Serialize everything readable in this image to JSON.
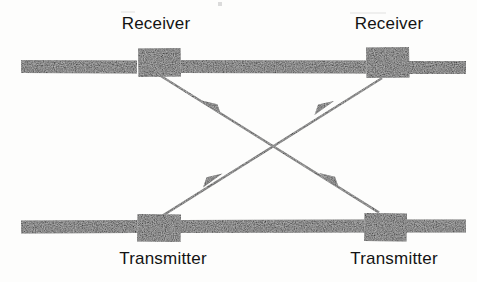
{
  "figure": {
    "width": 477,
    "height": 282,
    "background_color": "#fdfdfc",
    "ink_color": "#0d0d0d"
  },
  "labels": {
    "receiver_left": "Receiver",
    "receiver_right": "Receiver",
    "transmitter_left": "Transmitter",
    "transmitter_right": "Transmitter"
  },
  "diagram_data": {
    "type": "diagram",
    "lines": [
      {
        "name": "upper-line",
        "role": "receiver-line",
        "y": 66,
        "bar_thickness": 13,
        "segments": [
          {
            "x1": 21,
            "x2": 137
          },
          {
            "x1": 181,
            "x2": 366
          },
          {
            "x1": 409,
            "x2": 466
          }
        ]
      },
      {
        "name": "lower-line",
        "role": "transmitter-line",
        "y": 226,
        "bar_thickness": 13,
        "segments": [
          {
            "x1": 21,
            "x2": 137
          },
          {
            "x1": 180,
            "x2": 364
          },
          {
            "x1": 406,
            "x2": 466
          }
        ]
      }
    ],
    "devices": [
      {
        "name": "receiver-block-left",
        "label": "Receiver",
        "x": 138,
        "y": 48,
        "width": 43,
        "height": 29
      },
      {
        "name": "receiver-block-right",
        "label": "Receiver",
        "x": 366,
        "y": 47,
        "width": 43,
        "height": 31
      },
      {
        "name": "transmitter-block-left",
        "label": "Transmitter",
        "x": 137,
        "y": 214,
        "width": 44,
        "height": 28
      },
      {
        "name": "transmitter-block-right",
        "label": "Transmitter",
        "x": 364,
        "y": 213,
        "width": 43,
        "height": 29
      }
    ],
    "signal_paths": [
      {
        "name": "path-tx-left-to-rx-right",
        "from": "transmitter-block-left",
        "to": "receiver-block-right",
        "x1": 161,
        "y1": 215,
        "x2": 381,
        "y2": 78,
        "arrowheads": [
          {
            "x": 211,
            "y": 184,
            "direction": "up-right"
          },
          {
            "x": 323,
            "y": 108,
            "direction": "up-right"
          }
        ]
      },
      {
        "name": "path-tx-right-to-rx-left",
        "from": "transmitter-block-right",
        "to": "receiver-block-left",
        "x1": 379,
        "y1": 214,
        "x2": 160,
        "y2": 77,
        "arrowheads": [
          {
            "x": 331,
            "y": 184,
            "direction": "up-left"
          },
          {
            "x": 213,
            "y": 108,
            "direction": "up-left"
          }
        ]
      }
    ]
  }
}
